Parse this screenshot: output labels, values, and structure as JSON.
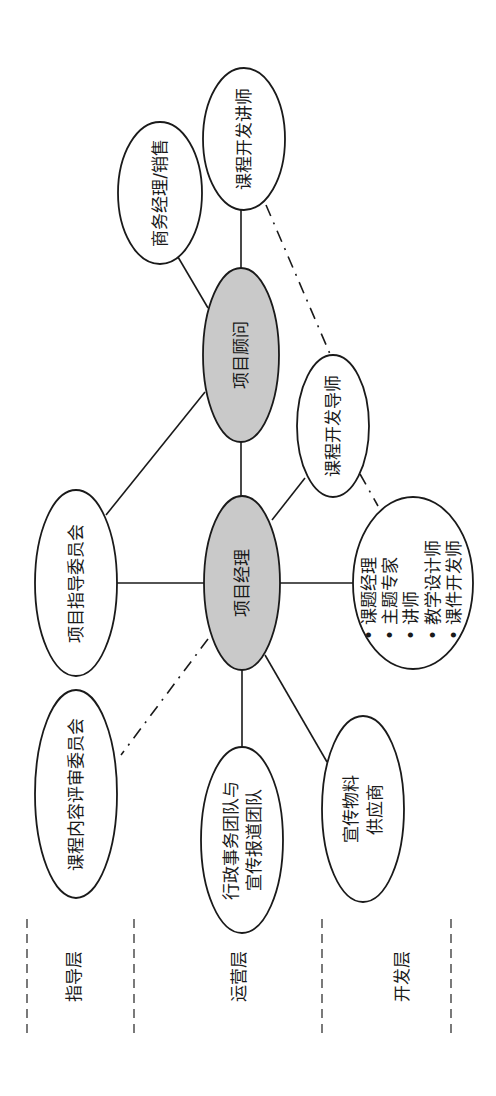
{
  "diagram": {
    "orientation": "rotated-90-ccw",
    "colors": {
      "core_fill": "#c9c9c9",
      "node_fill": "#ffffff",
      "stroke": "#1a1a1a"
    },
    "nodes": {
      "course_dev_lecturer": {
        "label": "课程开发讲师"
      },
      "business_manager": {
        "label": "商务经理/销售"
      },
      "project_consultant": {
        "label": "项目顾问"
      },
      "course_dev_mentor": {
        "label": "课程开发导师"
      },
      "steering_committee": {
        "label": "项目指导委员会"
      },
      "project_manager": {
        "label": "项目经理"
      },
      "dev_team": {
        "items": [
          "• 课题经理",
          "• 主题专家",
          "• 讲师",
          "• 教学设计师",
          "• 课件开发师"
        ]
      },
      "content_review_committee": {
        "label": "课程内容评审委员会"
      },
      "admin_team": {
        "lines": [
          "行政事务团队与",
          "宣传报道团队"
        ]
      },
      "promo_supplier": {
        "lines": [
          "宣传物料",
          "供应商"
        ]
      }
    },
    "layers": [
      {
        "label": "指导层"
      },
      {
        "label": "运营层"
      },
      {
        "label": "开发层"
      }
    ],
    "edges": [
      {
        "from": "project_consultant",
        "to": "course_dev_lecturer",
        "style": "solid"
      },
      {
        "from": "project_consultant",
        "to": "business_manager",
        "style": "solid"
      },
      {
        "from": "project_consultant",
        "to": "project_manager",
        "style": "solid"
      },
      {
        "from": "project_consultant",
        "to": "steering_committee",
        "style": "solid"
      },
      {
        "from": "project_manager",
        "to": "steering_committee",
        "style": "solid"
      },
      {
        "from": "project_manager",
        "to": "course_dev_mentor",
        "style": "solid"
      },
      {
        "from": "project_manager",
        "to": "dev_team",
        "style": "solid"
      },
      {
        "from": "project_manager",
        "to": "admin_team",
        "style": "solid"
      },
      {
        "from": "project_manager",
        "to": "promo_supplier",
        "style": "solid"
      },
      {
        "from": "project_manager",
        "to": "content_review_committee",
        "style": "dash-dot"
      },
      {
        "from": "course_dev_lecturer",
        "to": "course_dev_mentor",
        "style": "dash-dot"
      },
      {
        "from": "course_dev_mentor",
        "to": "dev_team",
        "style": "dash-dot"
      }
    ]
  }
}
